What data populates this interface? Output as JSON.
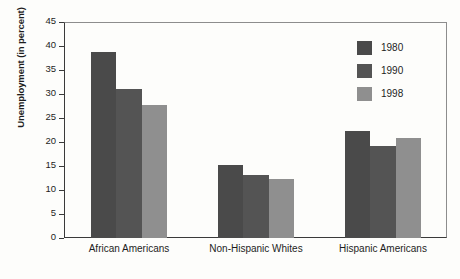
{
  "chart_data": {
    "type": "bar",
    "title": "",
    "xlabel": "",
    "ylabel": "Unemployment (in percent)",
    "categories": [
      "African Americans",
      "Non-Hispanic Whites",
      "Hispanic Americans"
    ],
    "series": [
      {
        "name": "1980",
        "color": "#4a4a4a",
        "values": [
          38.7,
          15.1,
          22.3
        ]
      },
      {
        "name": "1990",
        "color": "#545454",
        "values": [
          31.0,
          13.1,
          19.2
        ]
      },
      {
        "name": "1998",
        "color": "#8f8f8f",
        "values": [
          27.6,
          12.2,
          20.8
        ]
      }
    ],
    "ylim": [
      0,
      45
    ],
    "yticks": [
      0,
      5,
      10,
      15,
      20,
      25,
      30,
      35,
      40,
      45
    ],
    "ytick_labels": [
      "0",
      "5",
      "10",
      "15",
      "20",
      "25",
      "30",
      "35",
      "40",
      "45"
    ],
    "grid": false,
    "legend_position": "top-right",
    "legend_entries": [
      "1980",
      "1990",
      "1998"
    ]
  }
}
